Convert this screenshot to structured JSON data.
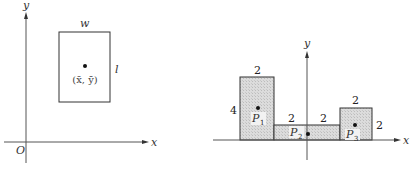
{
  "left_figure": {
    "axes": {
      "x_label": "x",
      "y_label": "y",
      "origin_label": "O"
    },
    "rectangle": {
      "width_label": "w",
      "length_label": "l",
      "centroid_label": "(x̄, ȳ)"
    }
  },
  "right_figure": {
    "axes": {
      "x_label": "x",
      "y_label": "y"
    },
    "rectangles": [
      {
        "name": "P",
        "sub": "1",
        "top_label": "2",
        "side_label": "4"
      },
      {
        "name": "P",
        "sub": "2",
        "top_label_left": "2",
        "top_label_right": "2"
      },
      {
        "name": "P",
        "sub": "3",
        "top_label": "2",
        "side_label": "2"
      }
    ]
  },
  "colors": {
    "line": "#333333",
    "fill": "#d6d6d6",
    "dot": "#111111"
  }
}
